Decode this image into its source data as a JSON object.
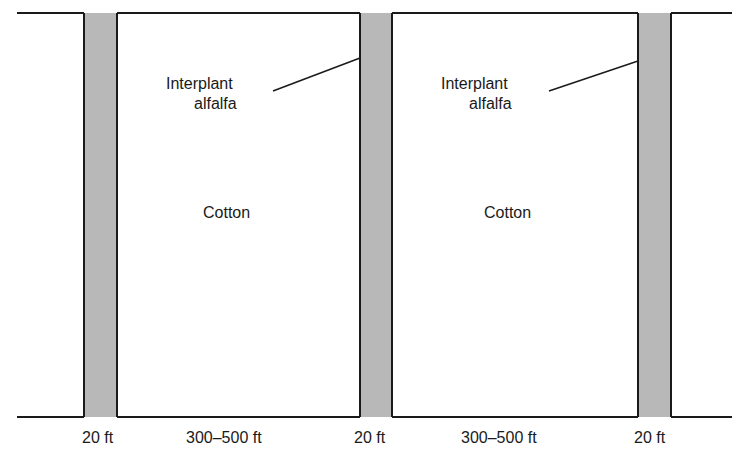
{
  "diagram": {
    "colors": {
      "line": "#1a1a1a",
      "strip_fill": "#b8b8b8",
      "field_fill": "#ffffff"
    },
    "fields": [
      {
        "label": "Cotton",
        "width_label": "300–500 ft"
      },
      {
        "label": "Cotton",
        "width_label": "300–500 ft"
      }
    ],
    "strips": [
      {
        "crop": "alfalfa",
        "width_label": "20 ft"
      },
      {
        "crop": "alfalfa",
        "width_label": "20 ft"
      },
      {
        "crop": "alfalfa",
        "width_label": "20 ft"
      }
    ],
    "callouts": [
      {
        "line1": "Interplant",
        "line2": "alfalfa"
      },
      {
        "line1": "Interplant",
        "line2": "alfalfa"
      }
    ]
  }
}
